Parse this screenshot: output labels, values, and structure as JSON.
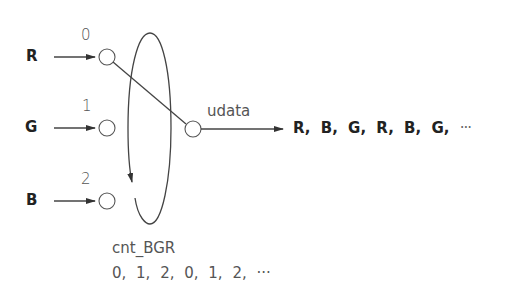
{
  "diagram": {
    "inputs": [
      {
        "label": "R",
        "index": "0"
      },
      {
        "label": "G",
        "index": "1"
      },
      {
        "label": "B",
        "index": "2"
      }
    ],
    "output_node_label": "udata",
    "output_sequence": "R, B, G, R, B, G,",
    "output_ellipsis": "···",
    "counter_label": "cnt_BGR",
    "counter_sequence": "0, 1, 2, 0, 1, 2, ···",
    "colors": {
      "stroke": "#444444",
      "text": "#222222",
      "light_text": "#555555",
      "background": "#ffffff"
    }
  }
}
